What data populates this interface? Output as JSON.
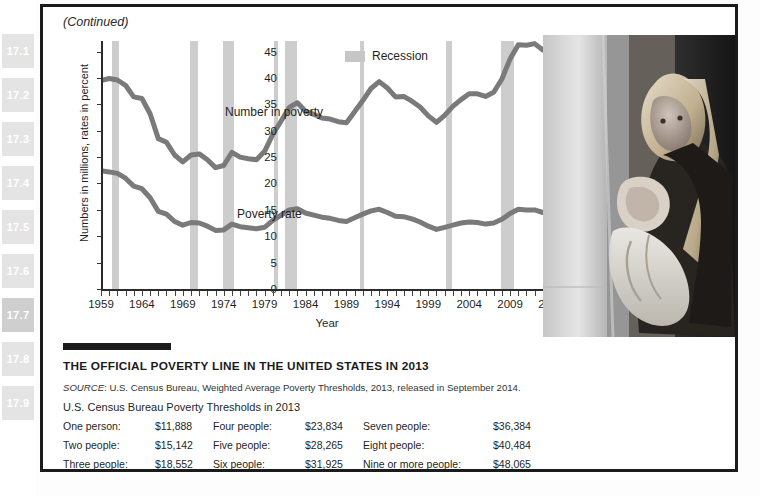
{
  "sidebar": {
    "items": [
      {
        "label": "17.1",
        "active": false
      },
      {
        "label": "17.2",
        "active": false
      },
      {
        "label": "17.3",
        "active": false
      },
      {
        "label": "17.4",
        "active": false
      },
      {
        "label": "17.5",
        "active": false
      },
      {
        "label": "17.6",
        "active": false
      },
      {
        "label": "17.7",
        "active": true
      },
      {
        "label": "17.8",
        "active": false
      },
      {
        "label": "17.9",
        "active": false
      }
    ]
  },
  "figure": {
    "continued_label": "(Continued)"
  },
  "chart_data": {
    "type": "line",
    "title": "",
    "xlabel": "Year",
    "ylabel": "Numbers in millions, rates in percent",
    "ylim": [
      0,
      47
    ],
    "yticks": [
      0,
      5,
      10,
      15,
      20,
      25,
      30,
      35,
      40,
      45
    ],
    "xlim": [
      1959,
      2014
    ],
    "xticks": [
      1959,
      1964,
      1969,
      1974,
      1979,
      1984,
      1989,
      1994,
      1999,
      2004,
      2009,
      2014
    ],
    "grid": false,
    "legend_position": "top-center",
    "legend": [
      {
        "label": "Recession",
        "color": "#c6c6c6",
        "kind": "band"
      }
    ],
    "line_color": "#7a7a7a",
    "series": [
      {
        "name": "Number in poverty",
        "annotation": "Number in poverty",
        "units": "millions",
        "x": [
          1959,
          1960,
          1961,
          1962,
          1963,
          1964,
          1965,
          1966,
          1967,
          1968,
          1969,
          1970,
          1971,
          1972,
          1973,
          1974,
          1975,
          1976,
          1977,
          1978,
          1979,
          1980,
          1981,
          1982,
          1983,
          1984,
          1985,
          1986,
          1987,
          1988,
          1989,
          1990,
          1991,
          1992,
          1993,
          1994,
          1995,
          1996,
          1997,
          1998,
          1999,
          2000,
          2001,
          2002,
          2003,
          2004,
          2005,
          2006,
          2007,
          2008,
          2009,
          2010,
          2011,
          2012,
          2013,
          2014
        ],
        "values": [
          39.5,
          39.9,
          39.6,
          38.6,
          36.4,
          36.1,
          33.2,
          28.5,
          27.8,
          25.4,
          24.1,
          25.4,
          25.6,
          24.5,
          23.0,
          23.4,
          25.9,
          25.0,
          24.7,
          24.5,
          26.1,
          29.3,
          31.8,
          34.4,
          35.3,
          33.7,
          33.1,
          32.4,
          32.2,
          31.7,
          31.5,
          33.6,
          35.7,
          38.0,
          39.3,
          38.1,
          36.4,
          36.5,
          35.6,
          34.5,
          32.8,
          31.6,
          32.9,
          34.6,
          35.9,
          37.0,
          37.0,
          36.5,
          37.3,
          39.8,
          43.6,
          46.3,
          46.2,
          46.5,
          45.3,
          46.7
        ]
      },
      {
        "name": "Poverty rate",
        "annotation": "Poverty rate",
        "units": "percent",
        "x": [
          1959,
          1960,
          1961,
          1962,
          1963,
          1964,
          1965,
          1966,
          1967,
          1968,
          1969,
          1970,
          1971,
          1972,
          1973,
          1974,
          1975,
          1976,
          1977,
          1978,
          1979,
          1980,
          1981,
          1982,
          1983,
          1984,
          1985,
          1986,
          1987,
          1988,
          1989,
          1990,
          1991,
          1992,
          1993,
          1994,
          1995,
          1996,
          1997,
          1998,
          1999,
          2000,
          2001,
          2002,
          2003,
          2004,
          2005,
          2006,
          2007,
          2008,
          2009,
          2010,
          2011,
          2012,
          2013,
          2014
        ],
        "values": [
          22.4,
          22.2,
          21.9,
          21.0,
          19.5,
          19.0,
          17.3,
          14.7,
          14.2,
          12.8,
          12.1,
          12.6,
          12.5,
          11.9,
          11.1,
          11.2,
          12.3,
          11.8,
          11.6,
          11.4,
          11.7,
          13.0,
          14.0,
          15.0,
          15.2,
          14.4,
          14.0,
          13.6,
          13.4,
          13.0,
          12.8,
          13.5,
          14.2,
          14.8,
          15.1,
          14.5,
          13.8,
          13.7,
          13.3,
          12.7,
          11.9,
          11.3,
          11.7,
          12.1,
          12.5,
          12.7,
          12.6,
          12.3,
          12.5,
          13.2,
          14.3,
          15.1,
          15.0,
          15.0,
          14.5,
          14.8
        ]
      }
    ],
    "recessions": [
      {
        "start": 1960.3,
        "end": 1961.2
      },
      {
        "start": 1969.9,
        "end": 1970.9
      },
      {
        "start": 1973.9,
        "end": 1975.2
      },
      {
        "start": 1980.1,
        "end": 1980.6
      },
      {
        "start": 1981.5,
        "end": 1982.9
      },
      {
        "start": 1990.6,
        "end": 1991.2
      },
      {
        "start": 2001.2,
        "end": 2001.9
      },
      {
        "start": 2007.9,
        "end": 2009.5
      }
    ]
  },
  "box": {
    "title": "THE OFFICIAL POVERTY LINE IN THE UNITED STATES IN 2013",
    "source_label": "SOURCE",
    "source_text": ": U.S. Census Bureau, Weighted Average Poverty Thresholds, 2013, released in September 2014.",
    "table_title": "U.S. Census Bureau Poverty Thresholds in 2013",
    "thresholds": [
      {
        "label": "One person:",
        "value": "$11,888",
        "wide": false
      },
      {
        "label": "Four people:",
        "value": "$23,834",
        "wide": false
      },
      {
        "label": "Seven people:",
        "value": "$36,384",
        "wide": true
      },
      {
        "label": "Two people:",
        "value": "$15,142",
        "wide": false
      },
      {
        "label": "Five people:",
        "value": "$28,265",
        "wide": false
      },
      {
        "label": "Eight people:",
        "value": "$40,484",
        "wide": true
      },
      {
        "label": "Three people:",
        "value": "$18,552",
        "wide": false
      },
      {
        "label": "Six people:",
        "value": "$31,925",
        "wide": false
      },
      {
        "label": "Nine or more people:",
        "value": "$48,065",
        "wide": true
      }
    ]
  },
  "photo": {
    "caption_alt": "Woman holding infant near window"
  }
}
